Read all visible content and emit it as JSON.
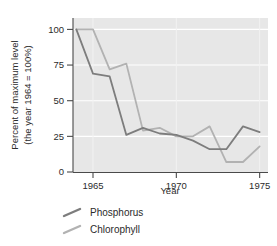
{
  "chart_data": {
    "type": "line",
    "title": "",
    "xlabel": "Year",
    "ylabel": "Percent of maximum level\n(the year 1964 = 100%)",
    "ylabel_line1": "Percent of maximum level",
    "ylabel_line2": "(the year 1964 = 100%)",
    "x": [
      1964,
      1965,
      1966,
      1967,
      1968,
      1969,
      1970,
      1971,
      1972,
      1973,
      1974,
      1975
    ],
    "xlim": [
      1963.8,
      1975.5
    ],
    "ylim": [
      0,
      108
    ],
    "xticks": [
      1965,
      1970,
      1975
    ],
    "xtick_labels": [
      "1965",
      "1970",
      "1975"
    ],
    "yticks": [
      0,
      25,
      50,
      75,
      100
    ],
    "ytick_labels": [
      "0",
      "25",
      "50",
      "75",
      "100"
    ],
    "grid": "horizontal-white",
    "legend_position": "below-left",
    "plot_background": "#e7e7e7",
    "series": [
      {
        "name": "Phosphorus",
        "color": "#7d7d7d",
        "values": [
          100,
          69,
          67,
          26,
          31,
          27,
          26,
          22,
          16,
          16,
          32,
          28
        ]
      },
      {
        "name": "Chlorophyll",
        "color": "#b2b2b2",
        "values": [
          100,
          100,
          72,
          76,
          29,
          31,
          25,
          25,
          32,
          7,
          7,
          18
        ]
      }
    ]
  },
  "legend": {
    "items": [
      {
        "label": "Phosphorus",
        "color": "#7d7d7d"
      },
      {
        "label": "Chlorophyll",
        "color": "#b2b2b2"
      }
    ]
  }
}
